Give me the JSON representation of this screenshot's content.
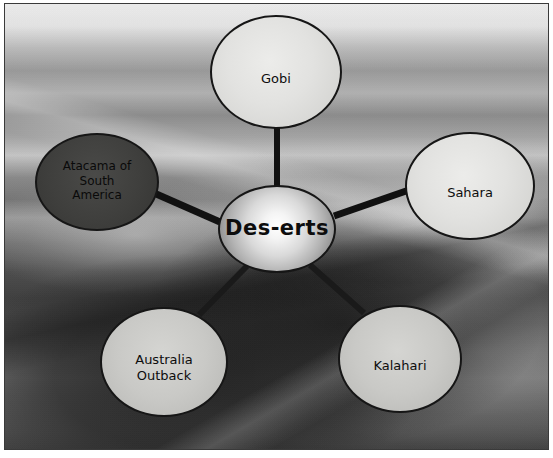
{
  "diagram": {
    "type": "concept-map",
    "title": "Des-erts",
    "background_image": "desert-dunes-photograph",
    "center": {
      "id": "center",
      "label": "Des-erts",
      "shape": "ellipse",
      "fill": "#d9d9d9",
      "border": "#161616",
      "cx": 277,
      "cy": 229,
      "rx": 59,
      "ry": 44
    },
    "nodes": [
      {
        "id": "gobi",
        "label": "Gobi",
        "shape": "ellipse",
        "fill": "#e2e2e0",
        "border": "#161616",
        "cx": 276,
        "cy": 72,
        "rx": 66,
        "ry": 57
      },
      {
        "id": "sahara",
        "label": "Sahara",
        "shape": "ellipse",
        "fill": "#e2e2e0",
        "border": "#161616",
        "cx": 470,
        "cy": 186,
        "rx": 65,
        "ry": 54
      },
      {
        "id": "atacama",
        "label": "Atacama of\nSouth\nAmerica",
        "shape": "ellipse",
        "fill": "#3f3f3d",
        "border": "#161616",
        "cx": 97,
        "cy": 182,
        "rx": 62,
        "ry": 49
      },
      {
        "id": "australia",
        "label": "Australia\nOutback",
        "shape": "ellipse",
        "fill": "#c9c9c6",
        "border": "#161616",
        "cx": 164,
        "cy": 362,
        "rx": 64,
        "ry": 55
      },
      {
        "id": "kalahari",
        "label": "Kalahari",
        "shape": "ellipse",
        "fill": "#c9c9c6",
        "border": "#161616",
        "cx": 400,
        "cy": 359,
        "rx": 62,
        "ry": 54
      }
    ],
    "links": [
      {
        "id": "center-gobi",
        "from": "center",
        "to": "gobi",
        "x1": 277,
        "y1": 188,
        "x2": 277,
        "y2": 128,
        "width": 6,
        "color": "#111111"
      },
      {
        "id": "center-sahara",
        "from": "center",
        "to": "sahara",
        "x1": 334,
        "y1": 216,
        "x2": 409,
        "y2": 190,
        "width": 7,
        "color": "#111111"
      },
      {
        "id": "center-atacama",
        "from": "center",
        "to": "atacama",
        "x1": 220,
        "y1": 222,
        "x2": 154,
        "y2": 193,
        "width": 7,
        "color": "#111111"
      },
      {
        "id": "center-australia",
        "from": "center",
        "to": "australia",
        "x1": 247,
        "y1": 266,
        "x2": 199,
        "y2": 315,
        "width": 6,
        "color": "#1a1a1a"
      },
      {
        "id": "center-kalahari",
        "from": "center",
        "to": "kalahari",
        "x1": 310,
        "y1": 265,
        "x2": 364,
        "y2": 313,
        "width": 6,
        "color": "#1a1a1a"
      }
    ]
  }
}
